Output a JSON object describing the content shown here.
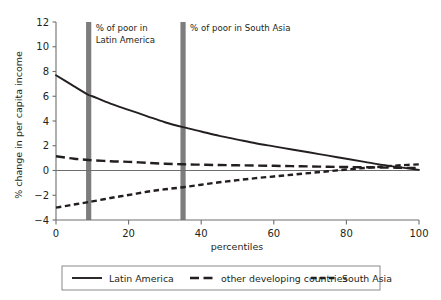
{
  "chart_data": {
    "type": "line",
    "title": "",
    "subtitle": "",
    "xlabel": "percentiles",
    "ylabel": "% change in per capita income",
    "xlim": [
      0,
      100
    ],
    "ylim": [
      -4,
      12
    ],
    "xticks": [
      0,
      20,
      40,
      60,
      80,
      100
    ],
    "xtick_labels": [
      "0",
      "20",
      "40",
      "60",
      "80",
      "100"
    ],
    "yticks": [
      -4,
      -2,
      0,
      2,
      4,
      6,
      8,
      10,
      12
    ],
    "ytick_labels": [
      "−4",
      "−2",
      "0",
      "2",
      "4",
      "6",
      "8",
      "10",
      "12"
    ],
    "grid": false,
    "zero_line": true,
    "legend_position": "bottom",
    "x": [
      0,
      5,
      9,
      10,
      15,
      20,
      25,
      30,
      35,
      40,
      45,
      50,
      55,
      60,
      65,
      70,
      75,
      80,
      85,
      90,
      95,
      100
    ],
    "series": [
      {
        "name": "Latin America",
        "style": "solid",
        "color": "#231f20",
        "values": [
          7.7,
          6.8,
          6.1,
          6.0,
          5.4,
          4.9,
          4.4,
          3.9,
          3.5,
          3.15,
          2.8,
          2.5,
          2.2,
          1.95,
          1.7,
          1.45,
          1.2,
          0.95,
          0.7,
          0.45,
          0.25,
          0.05
        ]
      },
      {
        "name": "other developing countries",
        "style": "dashed",
        "color": "#231f20",
        "values": [
          1.15,
          0.95,
          0.85,
          0.83,
          0.75,
          0.7,
          0.62,
          0.55,
          0.5,
          0.47,
          0.44,
          0.42,
          0.4,
          0.38,
          0.35,
          0.33,
          0.3,
          0.28,
          0.26,
          0.24,
          0.22,
          0.2
        ]
      },
      {
        "name": "South Asia",
        "style": "dotted-dash",
        "color": "#231f20",
        "values": [
          -3.0,
          -2.75,
          -2.55,
          -2.5,
          -2.22,
          -1.98,
          -1.72,
          -1.52,
          -1.35,
          -1.15,
          -0.95,
          -0.78,
          -0.62,
          -0.48,
          -0.34,
          -0.2,
          -0.06,
          0.08,
          0.2,
          0.32,
          0.42,
          0.5
        ]
      }
    ],
    "vertical_markers": [
      {
        "name": "% of poor in Latin America",
        "x": 9,
        "label_lines": [
          "% of poor in",
          "Latin America"
        ],
        "color": "#7d7d7d"
      },
      {
        "name": "% of poor in South Asia",
        "x": 35,
        "label_lines": [
          "% of poor in South Asia"
        ],
        "color": "#7d7d7d"
      }
    ]
  },
  "legend": {
    "items": [
      {
        "label": "Latin America",
        "style": "solid"
      },
      {
        "label": "other developing countries",
        "style": "dashed"
      },
      {
        "label": "South Asia",
        "style": "dotted-dash"
      }
    ]
  },
  "colors": {
    "axis": "#6e6e6e",
    "line": "#231f20",
    "marker": "#7d7d7d",
    "background": "#ffffff",
    "legend_border": "#8a8a8a"
  }
}
